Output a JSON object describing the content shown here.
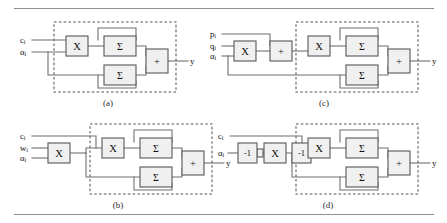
{
  "figure": {
    "type": "block-diagram-set",
    "panel_count": 4,
    "rules": {
      "top": "horizontal-rule",
      "bottom": "horizontal-rule"
    },
    "colors": {
      "wire": "#6f6f74",
      "block_fill": "#f0f0f0",
      "block_stroke": "#5e5e63",
      "dashed_box": "#55555a",
      "rule": "#8c8c91",
      "text": "#111111",
      "background": "#ffffff"
    }
  },
  "panels": [
    {
      "id": "a",
      "caption": "(a)",
      "inputs": [
        {
          "base": "c",
          "sub": "i"
        },
        {
          "base": "α",
          "sub": "i"
        }
      ],
      "output": "y",
      "pre_blocks": [],
      "core_blocks": [
        {
          "label": "X",
          "kind": "multiplier"
        },
        {
          "label": "Σ",
          "kind": "summer-upper"
        },
        {
          "label": "Σ",
          "kind": "summer-lower"
        },
        {
          "label": "+",
          "kind": "adder"
        }
      ]
    },
    {
      "id": "b",
      "caption": "(b)",
      "inputs": [
        {
          "base": "c",
          "sub": "i"
        },
        {
          "base": "w",
          "sub": "i"
        },
        {
          "base": "α",
          "sub": "i"
        }
      ],
      "output": "y",
      "pre_blocks": [
        {
          "label": "X",
          "kind": "multiplier"
        }
      ],
      "core_blocks": [
        {
          "label": "X",
          "kind": "multiplier"
        },
        {
          "label": "Σ",
          "kind": "summer-upper"
        },
        {
          "label": "Σ",
          "kind": "summer-lower"
        },
        {
          "label": "+",
          "kind": "adder"
        }
      ]
    },
    {
      "id": "c",
      "caption": "(c)",
      "inputs": [
        {
          "base": "p",
          "sub": "i"
        },
        {
          "base": "q",
          "sub": "i"
        },
        {
          "base": "α",
          "sub": "i"
        }
      ],
      "output": "y",
      "pre_blocks": [
        {
          "label": "X",
          "kind": "multiplier"
        },
        {
          "label": "+",
          "kind": "adder"
        }
      ],
      "core_blocks": [
        {
          "label": "X",
          "kind": "multiplier"
        },
        {
          "label": "Σ",
          "kind": "summer-upper"
        },
        {
          "label": "Σ",
          "kind": "summer-lower"
        },
        {
          "label": "+",
          "kind": "adder"
        }
      ]
    },
    {
      "id": "d",
      "caption": "(d)",
      "inputs": [
        {
          "base": "c",
          "sub": "i"
        },
        {
          "base": "α",
          "sub": "i"
        }
      ],
      "output": "y",
      "pre_blocks": [
        {
          "label": "-1",
          "kind": "negate"
        },
        {
          "label": "X",
          "kind": "multiplier"
        },
        {
          "label": "-1",
          "kind": "negate"
        }
      ],
      "core_blocks": [
        {
          "label": "X",
          "kind": "multiplier"
        },
        {
          "label": "Σ",
          "kind": "summer-upper"
        },
        {
          "label": "Σ",
          "kind": "summer-lower"
        },
        {
          "label": "+",
          "kind": "adder"
        }
      ]
    }
  ]
}
